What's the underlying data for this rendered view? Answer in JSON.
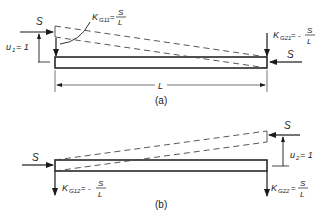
{
  "figure_a": {
    "caption": "(a)",
    "force_left": "S",
    "force_right": "S",
    "displacement": "u",
    "displacement_sub": "1",
    "displacement_eq": "= 1",
    "k11": {
      "symbol": "K",
      "sub": "G11",
      "eq": "=",
      "num": "S",
      "den": "L"
    },
    "k21": {
      "symbol": "K",
      "sub": "G21",
      "eq": "= -",
      "num": "S",
      "den": "L"
    },
    "length": "L"
  },
  "figure_b": {
    "caption": "(b)",
    "force_left": "S",
    "force_right": "S",
    "displacement": "u",
    "displacement_sub": "2",
    "displacement_eq": "= 1",
    "k12": {
      "symbol": "K",
      "sub": "G12",
      "eq": "= -",
      "num": "S",
      "den": "L"
    },
    "k22": {
      "symbol": "K",
      "sub": "G22",
      "eq": "=",
      "num": "S",
      "den": "L"
    }
  },
  "colors": {
    "line": "#1a1a1a",
    "background": "#ffffff"
  }
}
